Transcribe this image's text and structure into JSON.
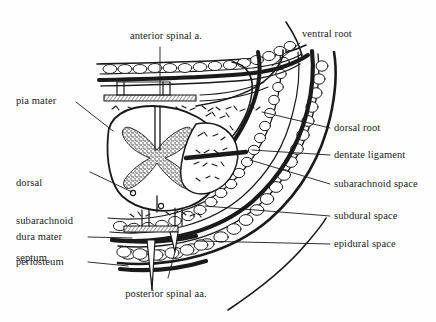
{
  "figure": {
    "background_color": "#fefefe",
    "ink_color": "#1a1a1a",
    "text_color": "#1c1c1c"
  },
  "labels": {
    "anterior_spinal_artery": "anterior spinal a.",
    "ventral_root": "ventral root",
    "pia_mater": "pia mater",
    "dorsal_root": "dorsal root",
    "dentate_ligament": "dentate ligament",
    "dorsal_subarachnoid_septum_line1": "dorsal",
    "dorsal_subarachnoid_septum_line2": "subarachnoid",
    "dorsal_subarachnoid_septum_line3": "septum",
    "subarachnoid_space": "subarachnoid space",
    "subdural_space": "subdural space",
    "dura_mater": "dura mater",
    "epidural_space": "epidural space",
    "periosteum": "periosteum",
    "posterior_spinal_arteries": "posterior spinal aa."
  },
  "structures": {
    "gray_matter": "butterfly-shaped gray matter",
    "white_matter": "white matter",
    "dural_sac": "dural sac",
    "bone_trabeculae": "vertebral bone trabeculae",
    "epidural_fat": "epidural fat cells",
    "nerve_root_sleeve": "nerve root sleeve"
  }
}
